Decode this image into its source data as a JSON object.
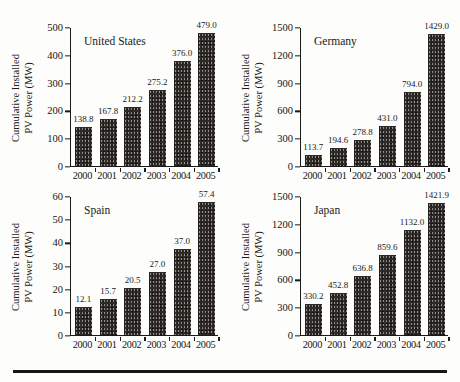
{
  "figure": {
    "background": "#fdfdfb",
    "text_color": "#1a1a1a",
    "axis_color": "#1a1a1a",
    "bar_color": "#2e2b28",
    "bottom_rule_color": "#161616"
  },
  "chart_data": [
    {
      "type": "bar",
      "title": "United States",
      "categories": [
        "2000",
        "2001",
        "2002",
        "2003",
        "2004",
        "2005"
      ],
      "values": [
        138.8,
        167.8,
        212.2,
        275.2,
        376.0,
        479.0
      ],
      "value_labels": [
        "138.8",
        "167.8",
        "212.2",
        "275.2",
        "376.0",
        "479.0"
      ],
      "xlabel": "",
      "ylabel": "Cumulative Installed PV Power (MW)",
      "ylabel_lines": [
        "Cumulative Installed",
        "PV Power (MW)"
      ],
      "ylim": [
        0,
        500
      ],
      "yticks": [
        0,
        100,
        200,
        300,
        400,
        500
      ],
      "grid": "off",
      "legend": "none"
    },
    {
      "type": "bar",
      "title": "Germany",
      "categories": [
        "2000",
        "2001",
        "2002",
        "2003",
        "2004",
        "2005"
      ],
      "values": [
        113.7,
        194.6,
        278.8,
        431.0,
        794.0,
        1429.0
      ],
      "value_labels": [
        "113.7",
        "194.6",
        "278.8",
        "431.0",
        "794.0",
        "1429.0"
      ],
      "xlabel": "",
      "ylabel": "Cumulative Installed PV Power (MW)",
      "ylabel_lines": [
        "Cumulative Installed",
        "PV Power (MW)"
      ],
      "ylim": [
        0,
        1500
      ],
      "yticks": [
        0,
        300,
        600,
        900,
        1200,
        1500
      ],
      "grid": "off",
      "legend": "none"
    },
    {
      "type": "bar",
      "title": "Spain",
      "categories": [
        "2000",
        "2001",
        "2002",
        "2003",
        "2004",
        "2005"
      ],
      "values": [
        12.1,
        15.7,
        20.5,
        27.0,
        37.0,
        57.4
      ],
      "value_labels": [
        "12.1",
        "15.7",
        "20.5",
        "27.0",
        "37.0",
        "57.4"
      ],
      "xlabel": "",
      "ylabel": "Cumulative Installed PV Power (MW)",
      "ylabel_lines": [
        "Cumulative Installed",
        "PV Power (MW)"
      ],
      "ylim": [
        0,
        60
      ],
      "yticks": [
        0,
        10,
        20,
        30,
        40,
        50,
        60
      ],
      "grid": "off",
      "legend": "none"
    },
    {
      "type": "bar",
      "title": "Japan",
      "categories": [
        "2000",
        "2001",
        "2002",
        "2003",
        "2004",
        "2005"
      ],
      "values": [
        330.2,
        452.8,
        636.8,
        859.6,
        1132.0,
        1421.9
      ],
      "value_labels": [
        "330.2",
        "452.8",
        "636.8",
        "859.6",
        "1132.0",
        "1421.9"
      ],
      "xlabel": "",
      "ylabel": "Cumulative Installed PV Power (MW)",
      "ylabel_lines": [
        "Cumulative Installed",
        "PV Power (MW)"
      ],
      "ylim": [
        0,
        1500
      ],
      "yticks": [
        0,
        300,
        600,
        900,
        1200,
        1500
      ],
      "grid": "off",
      "legend": "none"
    }
  ]
}
